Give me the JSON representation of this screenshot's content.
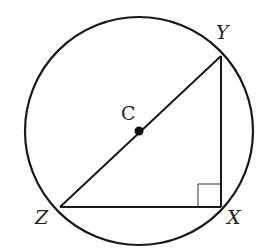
{
  "diagram": {
    "type": "geometry",
    "circle": {
      "center_label": "C",
      "cx": 139,
      "cy": 131,
      "r": 114
    },
    "points": {
      "Y": {
        "label": "Y",
        "x": 221,
        "y": 56
      },
      "X": {
        "label": "X",
        "x": 221,
        "y": 207
      },
      "Z": {
        "label": "Z",
        "x": 60,
        "y": 207
      },
      "C": {
        "label": "C",
        "x": 139,
        "y": 131
      }
    },
    "right_angle_at": "X",
    "stroke_color": "#1a1a1a"
  }
}
